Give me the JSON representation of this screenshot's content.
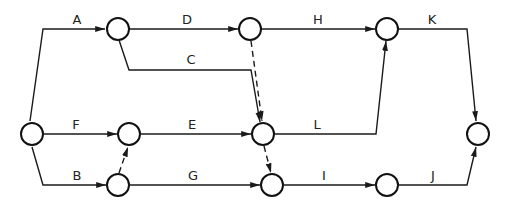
{
  "diagram": {
    "type": "activity-on-arrow network",
    "colors": {
      "line": "#1a1a1a",
      "node_stroke": "#111111",
      "background": "#ffffff"
    },
    "nodes": [
      {
        "id": "n1",
        "x": 32,
        "y": 134
      },
      {
        "id": "n2",
        "x": 118,
        "y": 29
      },
      {
        "id": "n3",
        "x": 250,
        "y": 29
      },
      {
        "id": "n4",
        "x": 387,
        "y": 29
      },
      {
        "id": "n5",
        "x": 129,
        "y": 134
      },
      {
        "id": "n6",
        "x": 263,
        "y": 134
      },
      {
        "id": "n7",
        "x": 478,
        "y": 134
      },
      {
        "id": "n8",
        "x": 118,
        "y": 185
      },
      {
        "id": "n9",
        "x": 272,
        "y": 185
      },
      {
        "id": "n10",
        "x": 387,
        "y": 185
      }
    ],
    "activities": [
      {
        "label": "A",
        "from": "n1",
        "to": "n2"
      },
      {
        "label": "D",
        "from": "n2",
        "to": "n3"
      },
      {
        "label": "H",
        "from": "n3",
        "to": "n4"
      },
      {
        "label": "K",
        "from": "n4",
        "to": "n7"
      },
      {
        "label": "C",
        "from": "n2",
        "to": "n6"
      },
      {
        "label": "F",
        "from": "n1",
        "to": "n5"
      },
      {
        "label": "E",
        "from": "n5",
        "to": "n6"
      },
      {
        "label": "L",
        "from": "n6",
        "to": "n4"
      },
      {
        "label": "B",
        "from": "n1",
        "to": "n8"
      },
      {
        "label": "G",
        "from": "n8",
        "to": "n9"
      },
      {
        "label": "I",
        "from": "n9",
        "to": "n10"
      },
      {
        "label": "J",
        "from": "n10",
        "to": "n7"
      }
    ],
    "dummies": [
      {
        "from": "n3",
        "to": "n6"
      },
      {
        "from": "n8",
        "to": "n5"
      },
      {
        "from": "n6",
        "to": "n9"
      }
    ],
    "labels": {
      "A": "A",
      "B": "B",
      "C": "C",
      "D": "D",
      "E": "E",
      "F": "F",
      "G": "G",
      "H": "H",
      "I": "I",
      "J": "J",
      "K": "K",
      "L": "L"
    }
  }
}
